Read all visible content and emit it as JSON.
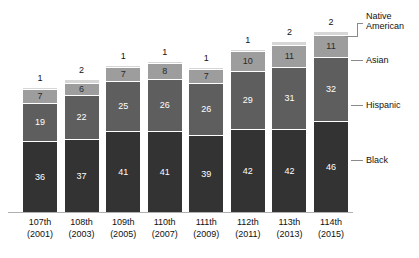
{
  "chart_data": {
    "type": "bar",
    "subtype": "stacked-bar",
    "title": "",
    "xlabel": "",
    "ylabel": "",
    "grid": false,
    "legend_position": "right",
    "ylim": [
      0,
      91
    ],
    "categories": [
      "107th",
      "108th",
      "109th",
      "110th",
      "111th",
      "112th",
      "113th",
      "114th"
    ],
    "category_sublabels": [
      "(2001)",
      "(2003)",
      "(2005)",
      "(2007)",
      "(2009)",
      "(2011)",
      "(2013)",
      "(2015)"
    ],
    "series": [
      {
        "name": "Black",
        "color": "#333333",
        "values": [
          36,
          37,
          41,
          41,
          39,
          42,
          42,
          46
        ]
      },
      {
        "name": "Hispanic",
        "color": "#5e5e5e",
        "values": [
          19,
          22,
          25,
          26,
          26,
          29,
          31,
          32
        ]
      },
      {
        "name": "Asian",
        "color": "#9d9d9d",
        "values": [
          7,
          6,
          7,
          8,
          7,
          10,
          11,
          11
        ]
      },
      {
        "name": "Native American",
        "color": "#d6d6d6",
        "values": [
          1,
          2,
          1,
          1,
          1,
          1,
          2,
          2
        ]
      }
    ],
    "totals": [
      63,
      67,
      74,
      76,
      73,
      82,
      86,
      91
    ]
  },
  "legend": {
    "items": [
      {
        "label": "Native\nAmerican"
      },
      {
        "label": "Asian"
      },
      {
        "label": "Hispanic"
      },
      {
        "label": "Black"
      }
    ]
  }
}
